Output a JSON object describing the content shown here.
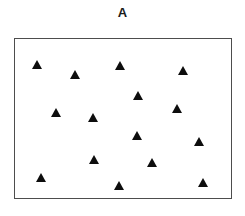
{
  "figure": {
    "title": "A",
    "marker_shape": "filled-triangle-up",
    "marker_color": "#0d0d0d",
    "frame_color": "#4d4d4d",
    "background_color": "#ffffff",
    "point_count": 15
  },
  "chart_data": {
    "type": "scatter",
    "title": "A",
    "xlabel": "",
    "ylabel": "",
    "xlim": [
      0,
      218
    ],
    "ylim": [
      0,
      161
    ],
    "grid": false,
    "legend": null,
    "axis_ticks": false,
    "series": [
      {
        "name": "A",
        "marker": "triangle-up",
        "color": "#0d0d0d",
        "points": [
          {
            "x": 22,
            "y": 26
          },
          {
            "x": 61,
            "y": 36
          },
          {
            "x": 106,
            "y": 27
          },
          {
            "x": 170,
            "y": 32
          },
          {
            "x": 124,
            "y": 58
          },
          {
            "x": 41,
            "y": 75
          },
          {
            "x": 163,
            "y": 71
          },
          {
            "x": 79,
            "y": 80
          },
          {
            "x": 123,
            "y": 98
          },
          {
            "x": 186,
            "y": 104
          },
          {
            "x": 80,
            "y": 123
          },
          {
            "x": 138,
            "y": 126
          },
          {
            "x": 26,
            "y": 141
          },
          {
            "x": 105,
            "y": 149
          },
          {
            "x": 190,
            "y": 146
          }
        ]
      }
    ]
  }
}
